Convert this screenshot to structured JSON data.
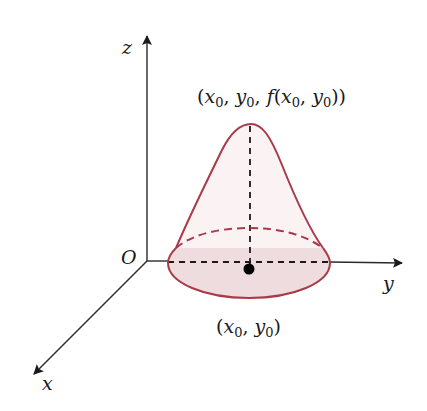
{
  "figure": {
    "type": "3d-surface-diagram"
  },
  "axes": {
    "x": {
      "label": "x"
    },
    "y": {
      "label": "y"
    },
    "z": {
      "label": "z"
    },
    "origin": {
      "label": "O"
    }
  },
  "labels": {
    "peak": {
      "open": "(",
      "x": "x",
      "x_sub": "0",
      "sep1": ", ",
      "y": "y",
      "y_sub": "0",
      "sep2": ", ",
      "f": "f",
      "open2": "(",
      "x2": "x",
      "x2_sub": "0",
      "sep3": ", ",
      "y2": "y",
      "y2_sub": "0",
      "close": "))"
    },
    "base_point": {
      "open": "(",
      "x": "x",
      "x_sub": "0",
      "sep": ", ",
      "y": "y",
      "y_sub": "0",
      "close": ")"
    }
  },
  "colors": {
    "axis": "#2a2a2a",
    "surface_stroke": "#a83a4a",
    "base_fill": "#eedcdf",
    "point": "#000000",
    "dashed_guides": "#1a1a1a"
  }
}
